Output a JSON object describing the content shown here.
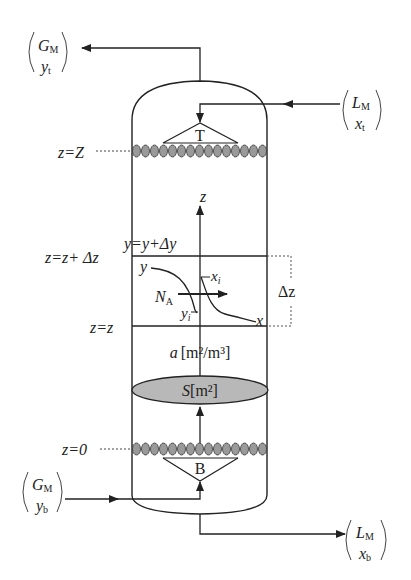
{
  "diagram": {
    "streams": {
      "gas_out": {
        "flow": "G",
        "flow_sub": "M",
        "comp": "y",
        "comp_sub": "t"
      },
      "liquid_in": {
        "flow": "L",
        "flow_sub": "M",
        "comp": "x",
        "comp_sub": "t"
      },
      "gas_in": {
        "flow": "G",
        "flow_sub": "M",
        "comp": "y",
        "comp_sub": "b"
      },
      "liquid_out": {
        "flow": "L",
        "flow_sub": "M",
        "comp": "x",
        "comp_sub": "b"
      }
    },
    "distributors": {
      "top": "T",
      "bottom": "B"
    },
    "levels": {
      "top": "z=Z",
      "upper": "z=z+ Δz",
      "lower": "z=z",
      "bottom": "z=0"
    },
    "axis_label": "z",
    "element": {
      "upper_condition": "y=y+Δy",
      "gas_curve_label": "y",
      "liquid_curve_label": "x",
      "interface_liquid": "x",
      "interface_liquid_sub": "i",
      "interface_gas": "y",
      "interface_gas_sub": "i",
      "flux": "N",
      "flux_sub": "A",
      "height": "Δz"
    },
    "specific_area": {
      "symbol": "a",
      "unit": "[m²/m³]"
    },
    "cross_section": {
      "symbol": "S",
      "unit": "[m²]"
    },
    "colors": {
      "line": "#222222",
      "packing_fill": "#9a9a9a",
      "section_fill": "#b8b8b8"
    }
  }
}
